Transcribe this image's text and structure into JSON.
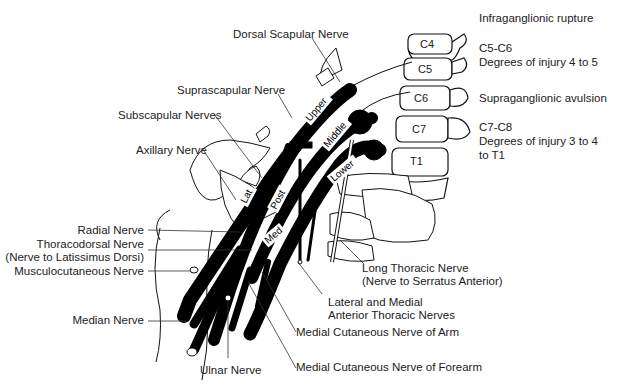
{
  "diagram": {
    "vertebrae": [
      "C4",
      "C5",
      "C6",
      "C7",
      "T1"
    ],
    "trunks": [
      "Upper",
      "Middle",
      "Lower"
    ],
    "cords": [
      "Lat",
      "Post",
      "Med"
    ],
    "labels": {
      "dorsal_scapular": "Dorsal Scapular Nerve",
      "suprascapular": "Suprascapular Nerve",
      "subscapular": "Subscapular Nerves",
      "axillary": "Axillary Nerve",
      "radial": "Radial Nerve",
      "thoracodorsal_1": "Thoracodorsal Nerve",
      "thoracodorsal_2": "(Nerve to Latissimus Dorsi)",
      "musculocutaneous": "Musculocutaneous Nerve",
      "median": "Median Nerve",
      "ulnar": "Ulnar Nerve",
      "long_thoracic_1": "Long Thoracic Nerve",
      "long_thoracic_2": "(Nerve to Serratus Anterior)",
      "anterior_thoracic_1": "Lateral and Medial",
      "anterior_thoracic_2": "Anterior Thoracic Nerves",
      "med_cut_arm": "Medial Cutaneous Nerve of Arm",
      "med_cut_forearm": "Medial Cutaneous Nerve of Forearm"
    },
    "legend": {
      "infra_title": "Infraganglionic rupture",
      "infra_levels": "C5-C6",
      "infra_degrees": "Degrees of injury 4 to 5",
      "supra_title": "Supraganglionic avulsion",
      "supra_levels": "C7-C8",
      "supra_degrees_1": "Degrees of injury 3 to 4",
      "supra_degrees_2": "to T1"
    }
  }
}
